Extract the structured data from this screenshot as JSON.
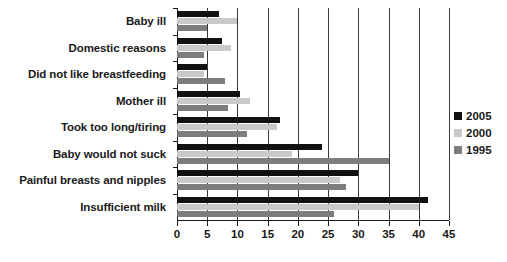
{
  "chart_data": {
    "type": "bar",
    "orientation": "horizontal",
    "title": "",
    "xlabel": "",
    "ylabel": "",
    "xlim": [
      0,
      45
    ],
    "xticks": [
      0,
      5,
      10,
      15,
      20,
      25,
      30,
      35,
      40,
      45
    ],
    "grid": true,
    "legend_position": "right",
    "categories": [
      "Baby ill",
      "Domestic reasons",
      "Did not like breastfeeding",
      "Mother ill",
      "Took too long/tiring",
      "Baby would not suck",
      "Painful breasts and nipples",
      "Insufficient milk"
    ],
    "series": [
      {
        "name": "2005",
        "color": "#111111",
        "values": [
          7,
          7.5,
          5,
          10.5,
          17,
          24,
          30,
          41.5
        ]
      },
      {
        "name": "2000",
        "color": "#c9c9c9",
        "values": [
          10,
          9,
          4.5,
          12,
          16.5,
          19,
          27,
          40
        ]
      },
      {
        "name": "1995",
        "color": "#7d7d7d",
        "values": [
          5,
          4.5,
          8,
          8.5,
          11.5,
          35,
          28,
          26
        ]
      }
    ]
  }
}
